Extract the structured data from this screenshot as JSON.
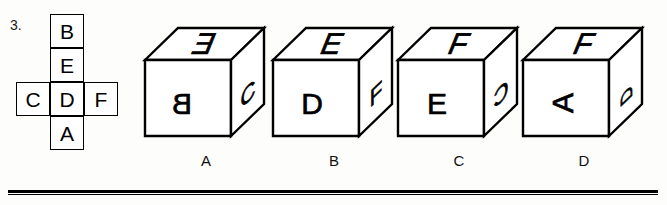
{
  "question": {
    "number": "3."
  },
  "net": {
    "description": "unfolded cube net, cross shape",
    "cells": [
      {
        "id": "top",
        "label": "B"
      },
      {
        "id": "upper-middle",
        "label": "E"
      },
      {
        "id": "left",
        "label": "C"
      },
      {
        "id": "center",
        "label": "D"
      },
      {
        "id": "right",
        "label": "F"
      },
      {
        "id": "bottom",
        "label": "A"
      }
    ]
  },
  "options": [
    {
      "label": "A",
      "faces": {
        "top": {
          "letter": "E",
          "orientation": "mirrored"
        },
        "front": {
          "letter": "B",
          "orientation": "mirrored"
        },
        "right": {
          "letter": "C",
          "orientation": "normal"
        }
      }
    },
    {
      "label": "B",
      "faces": {
        "top": {
          "letter": "E",
          "orientation": "normal"
        },
        "front": {
          "letter": "D",
          "orientation": "normal"
        },
        "right": {
          "letter": "F",
          "orientation": "normal"
        }
      }
    },
    {
      "label": "C",
      "faces": {
        "top": {
          "letter": "F",
          "orientation": "normal"
        },
        "front": {
          "letter": "E",
          "orientation": "normal"
        },
        "right": {
          "letter": "C",
          "orientation": "mirrored"
        }
      }
    },
    {
      "label": "D",
      "faces": {
        "top": {
          "letter": "F",
          "orientation": "normal"
        },
        "front": {
          "letter": "A",
          "orientation": "rotated-90-ccw"
        },
        "right": {
          "letter": "D",
          "orientation": "rotated-90-ccw"
        }
      }
    }
  ],
  "colors": {
    "ink": "#000000",
    "paper": "#fdfdfb"
  }
}
